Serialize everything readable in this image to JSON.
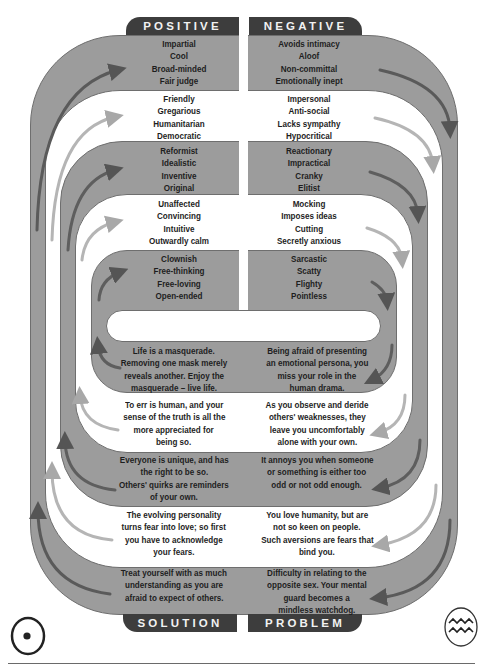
{
  "headers": {
    "top_left": "POSITIVE",
    "top_right": "NEGATIVE",
    "bottom_left": "SOLUTION",
    "bottom_right": "PROBLEM"
  },
  "positive": [
    [
      "Impartial",
      "Cool",
      "Broad-minded",
      "Fair judge"
    ],
    [
      "Friendly",
      "Gregarious",
      "Humanitarian",
      "Democratic"
    ],
    [
      "Reformist",
      "Idealistic",
      "Inventive",
      "Original"
    ],
    [
      "Unaffected",
      "Convincing",
      "Intuitive",
      "Outwardly calm"
    ],
    [
      "Clownish",
      "Free-thinking",
      "Free-loving",
      "Open-ended"
    ]
  ],
  "negative": [
    [
      "Avoids intimacy",
      "Aloof",
      "Non-committal",
      "Emotionally inept"
    ],
    [
      "Impersonal",
      "Anti-social",
      "Lacks sympathy",
      "Hypocritical"
    ],
    [
      "Reactionary",
      "Impractical",
      "Cranky",
      "Elitist"
    ],
    [
      "Mocking",
      "Imposes ideas",
      "Cutting",
      "Secretly anxious"
    ],
    [
      "Sarcastic",
      "Scatty",
      "Flighty",
      "Pointless"
    ]
  ],
  "solution": [
    [
      "Life is a masquerade.",
      "Removing one mask merely",
      "reveals another. Enjoy the",
      "masquerade – live life."
    ],
    [
      "To err is human, and your",
      "sense of the truth is all the",
      "more appreciated for",
      "being so."
    ],
    [
      "Everyone is unique, and has",
      "the right to be so.",
      "Others' quirks are reminders",
      "of your own."
    ],
    [
      "The evolving personality",
      "turns fear into love; so first",
      "you have to acknowledge",
      "your fears."
    ],
    [
      "Treat yourself with as much",
      "understanding as you are",
      "afraid to expect of others."
    ]
  ],
  "problem": [
    [
      "Being afraid of presenting",
      "an emotional persona, you",
      "miss your role in the",
      "human drama."
    ],
    [
      "As you observe and deride",
      "others' weaknesses, they",
      "leave you uncomfortably",
      "alone with your own."
    ],
    [
      "It annoys you when someone",
      "or something is either too",
      "odd or not odd enough."
    ],
    [
      "You love humanity, but are",
      "not so keen on people.",
      "Such aversions are fears that",
      "bind you."
    ],
    [
      "Difficulty in relating to the",
      "opposite sex. Your mental",
      "guard becomes a",
      "mindless watchdog."
    ]
  ],
  "symbols": {
    "left": "sun-symbol",
    "right": "aquarius-symbol"
  },
  "colors": {
    "band_gray": "#9c9c9c",
    "tab_dark": "#3d3d3d",
    "arrow_dark": "#5a5a5a",
    "arrow_light": "#b8b8b8"
  }
}
